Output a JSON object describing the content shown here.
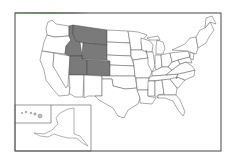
{
  "map": {
    "title": "United States map with highlighted Mountain West states",
    "highlight_color": "#7a7a7a",
    "base_color": "#ffffff",
    "border_color": "#444444",
    "highlighted_states": [
      "Idaho",
      "Montana",
      "Wyoming",
      "Utah",
      "Colorado"
    ],
    "inset": {
      "regions": [
        "Hawaii",
        "Alaska"
      ]
    }
  }
}
